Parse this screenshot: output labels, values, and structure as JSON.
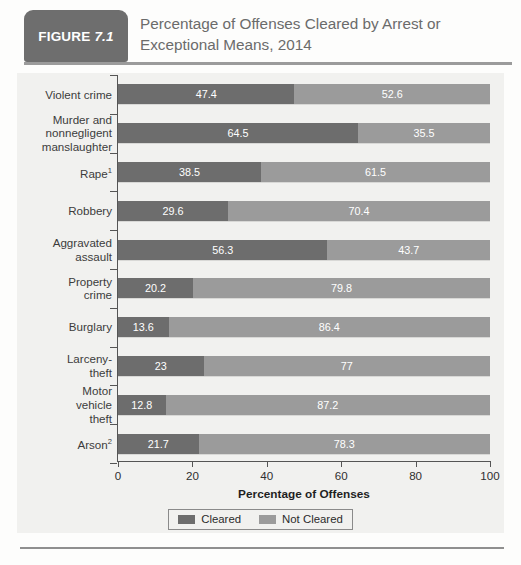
{
  "figure": {
    "badge_label": "FIGURE",
    "badge_number": "7.1",
    "title": "Percentage of Offenses Cleared by Arrest or Exceptional Means, 2014",
    "badge_color": "#6e6e6e",
    "title_color": "#6b6b6b"
  },
  "chart_data": {
    "type": "bar",
    "orientation": "horizontal",
    "stacked": true,
    "normalized_to_100": true,
    "title": "Percentage of Offenses Cleared by Arrest or Exceptional Means, 2014",
    "xlabel": "Percentage of Offenses",
    "ylabel": "",
    "xlim": [
      0,
      100
    ],
    "xticks": [
      0,
      20,
      40,
      60,
      80,
      100
    ],
    "xticklabels": [
      "0",
      "20",
      "40",
      "60",
      "80",
      "100"
    ],
    "grid": false,
    "legend_position": "bottom-center",
    "categories": [
      "Violent crime",
      "Murder and nonnegligent manslaughter",
      "Rape¹",
      "Robbery",
      "Aggravated assault",
      "Property crime",
      "Burglary",
      "Larceny-theft",
      "Motor vehicle theft",
      "Arson²"
    ],
    "series": [
      {
        "name": "Cleared",
        "color": "#6d6d6d",
        "values": [
          47.4,
          64.5,
          38.5,
          29.6,
          56.3,
          20.2,
          13.6,
          23,
          12.8,
          21.7
        ]
      },
      {
        "name": "Not Cleared",
        "color": "#9b9b9b",
        "values": [
          52.6,
          35.5,
          61.5,
          70.4,
          43.7,
          79.8,
          86.4,
          77,
          87.2,
          78.3
        ]
      }
    ]
  },
  "rows": [
    {
      "label_lines": [
        "Violent crime"
      ],
      "cleared": "47.4",
      "not_cleared": "52.6",
      "cleared_v": 47.4,
      "not_cleared_v": 52.6
    },
    {
      "label_lines": [
        "Murder and",
        "nonnegligent",
        "manslaughter"
      ],
      "cleared": "64.5",
      "not_cleared": "35.5",
      "cleared_v": 64.5,
      "not_cleared_v": 35.5
    },
    {
      "label_lines": [
        "Rape¹"
      ],
      "cleared": "38.5",
      "not_cleared": "61.5",
      "cleared_v": 38.5,
      "not_cleared_v": 61.5
    },
    {
      "label_lines": [
        "Robbery"
      ],
      "cleared": "29.6",
      "not_cleared": "70.4",
      "cleared_v": 29.6,
      "not_cleared_v": 70.4
    },
    {
      "label_lines": [
        "Aggravated",
        "assault"
      ],
      "cleared": "56.3",
      "not_cleared": "43.7",
      "cleared_v": 56.3,
      "not_cleared_v": 43.7
    },
    {
      "label_lines": [
        "Property",
        "crime"
      ],
      "cleared": "20.2",
      "not_cleared": "79.8",
      "cleared_v": 20.2,
      "not_cleared_v": 79.8
    },
    {
      "label_lines": [
        "Burglary"
      ],
      "cleared": "13.6",
      "not_cleared": "86.4",
      "cleared_v": 13.6,
      "not_cleared_v": 86.4
    },
    {
      "label_lines": [
        "Larceny-",
        "theft"
      ],
      "cleared": "23",
      "not_cleared": "77",
      "cleared_v": 23,
      "not_cleared_v": 77
    },
    {
      "label_lines": [
        "Motor",
        "vehicle",
        "theft"
      ],
      "cleared": "12.8",
      "not_cleared": "87.2",
      "cleared_v": 12.8,
      "not_cleared_v": 87.2
    },
    {
      "label_lines": [
        "Arson²"
      ],
      "cleared": "21.7",
      "not_cleared": "78.3",
      "cleared_v": 21.7,
      "not_cleared_v": 78.3
    }
  ],
  "axis": {
    "x_title": "Percentage of Offenses",
    "ticklabels": [
      "0",
      "20",
      "40",
      "60",
      "80",
      "100"
    ],
    "tickvalues": [
      0,
      20,
      40,
      60,
      80,
      100
    ]
  },
  "legend": {
    "items": [
      {
        "label": "Cleared",
        "color": "#6d6d6d"
      },
      {
        "label": "Not Cleared",
        "color": "#9b9b9b"
      }
    ]
  }
}
